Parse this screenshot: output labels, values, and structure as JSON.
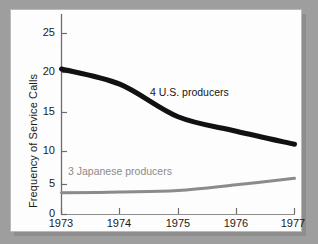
{
  "figure": {
    "panel_background": "#fdfdfd",
    "outer_background": "#9e9e9e",
    "frame_color": "#b9b9b9"
  },
  "chart_data": {
    "type": "line",
    "title": "",
    "xlabel": "",
    "ylabel": "Frequency of Service Calls",
    "x": [
      1973,
      1974,
      1975,
      1976,
      1977
    ],
    "xtick_labels": [
      "1973",
      "1974",
      "1975",
      "1976",
      "1977"
    ],
    "ytick_labels": [
      "0",
      "5",
      "10",
      "15",
      "20",
      "25"
    ],
    "yticks": [
      0,
      5,
      10,
      15,
      20,
      25
    ],
    "xlim": [
      1973,
      1977
    ],
    "ylim": [
      0,
      26.5
    ],
    "grid": false,
    "legend": "inline-annotations",
    "series": [
      {
        "name": "4 U.S. producers",
        "color": "#111111",
        "line_width": 5,
        "values": [
          20.1,
          18.0,
          13.5,
          11.5,
          9.7
        ],
        "label_x": 1974.55,
        "label_y": 17.1
      },
      {
        "name": "3 Japanese producers",
        "color": "#8b8b8b",
        "line_width": 3,
        "values": [
          3.0,
          3.1,
          3.3,
          4.1,
          5.0
        ],
        "label_x": 1973.5,
        "label_y": 6.3
      }
    ],
    "annotations": [
      {
        "text": "4 U.S. producers",
        "series": "4 U.S. producers"
      },
      {
        "text": "3 Japanese producers",
        "series": "3 Japanese producers"
      }
    ]
  }
}
